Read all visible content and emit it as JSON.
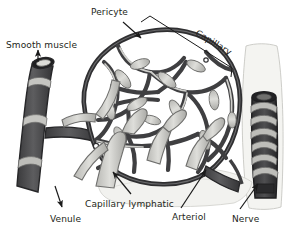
{
  "figure": {
    "style": "grayscale anatomical illustration",
    "background_color": "#ffffff",
    "label_color": "#231f20",
    "palette": {
      "vessel_dark": "#4a4a4c",
      "vessel_outline": "#2b2b2d",
      "lymphatic_light": "#c9c9c6",
      "lymphatic_outline": "#6f6f6e",
      "sheath_pale": "#efefec",
      "arrow": "#1a1a1a"
    },
    "labels": [
      {
        "id": "pericyte",
        "text": "Pericyte",
        "pointer": "arrow-down-left"
      },
      {
        "id": "smooth",
        "text": "Smooth muscle",
        "pointer": "arrow-up"
      },
      {
        "id": "capillary",
        "text": "Capillary",
        "pointer": "bracket-diagonal"
      },
      {
        "id": "venule",
        "text": "Venule",
        "pointer": "arrow-down-right"
      },
      {
        "id": "caplymph",
        "text": "Capillary lymphatic",
        "pointer": "arrow-up-right"
      },
      {
        "id": "arteriol",
        "text": "Arteriol",
        "pointer": "arrow-up-right"
      },
      {
        "id": "nerve",
        "text": "Nerve",
        "pointer": "arrow-up-right"
      }
    ],
    "structures": [
      {
        "id": "venule-vessel",
        "name": "Venule with smooth muscle bands",
        "tone": "dark"
      },
      {
        "id": "capillary-bed",
        "name": "Capillary network mesh",
        "tone": "dark"
      },
      {
        "id": "lymphatic-vessels",
        "name": "Blind-ended lymphatic capillaries",
        "tone": "light"
      },
      {
        "id": "arteriole-vessel",
        "name": "Arteriole entering bed",
        "tone": "dark"
      },
      {
        "id": "nerve-bundle",
        "name": "Nerve with spiral wrappings",
        "tone": "dark"
      },
      {
        "id": "fascia-sheet",
        "name": "Translucent fascia sheet",
        "tone": "pale"
      }
    ]
  }
}
